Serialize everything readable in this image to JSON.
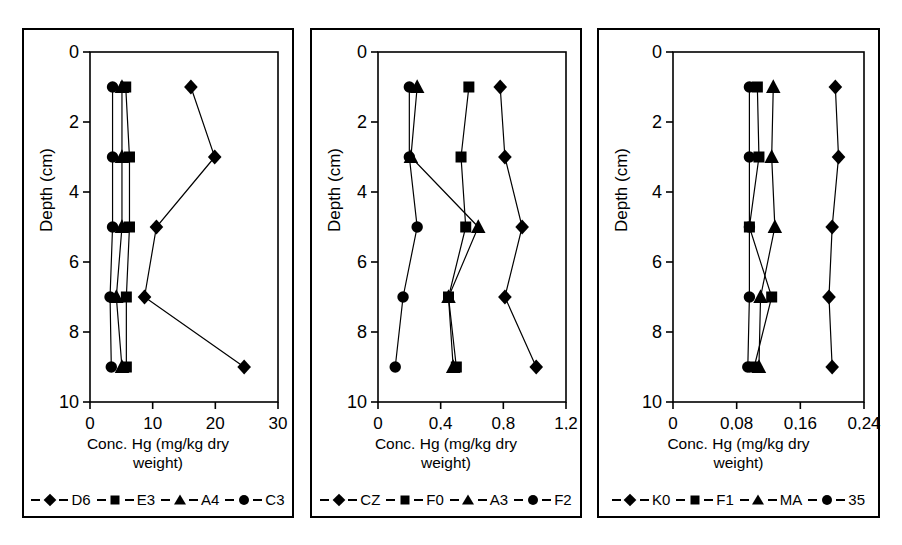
{
  "figure": {
    "panel_count": 3,
    "shared_xlabel": "Conc. Hg (mg/kg dry weight)",
    "shared_ylabel": "Depth (cm)"
  },
  "chart_data": [
    {
      "type": "line",
      "title": "",
      "xlabel": "Conc. Hg (mg/kg dry weight)",
      "ylabel": "Depth (cm)",
      "xlim": [
        0,
        30
      ],
      "ylim": [
        0,
        10
      ],
      "y_inverted": true,
      "xticks": [
        "0",
        "10",
        "20",
        "30"
      ],
      "xtick_values": [
        0,
        10,
        20,
        30
      ],
      "yticks": [
        "0",
        "2",
        "4",
        "6",
        "8",
        "10"
      ],
      "ytick_values": [
        0,
        2,
        4,
        6,
        8,
        10
      ],
      "grid": false,
      "legend_position": "bottom",
      "depths": [
        1,
        3,
        5,
        7,
        9
      ],
      "series": [
        {
          "name": "D6",
          "marker": "diamond",
          "values": [
            16.1,
            19.9,
            10.6,
            8.7,
            24.6
          ]
        },
        {
          "name": "E3",
          "marker": "square",
          "values": [
            5.7,
            6.3,
            6.3,
            5.8,
            5.8
          ]
        },
        {
          "name": "A4",
          "marker": "triangle",
          "values": [
            5.1,
            5.1,
            5.1,
            4.2,
            5.1
          ]
        },
        {
          "name": "C3",
          "marker": "circle",
          "values": [
            3.6,
            3.6,
            3.6,
            3.2,
            3.4
          ]
        }
      ]
    },
    {
      "type": "line",
      "title": "",
      "xlabel": "Conc. Hg (mg/kg dry weight)",
      "ylabel": "Depth (cm)",
      "xlim": [
        0,
        1.2
      ],
      "ylim": [
        0,
        10
      ],
      "y_inverted": true,
      "xticks": [
        "0",
        "0,4",
        "0,8",
        "1,2"
      ],
      "xtick_values": [
        0,
        0.4,
        0.8,
        1.2
      ],
      "yticks": [
        "0",
        "2",
        "4",
        "6",
        "8",
        "10"
      ],
      "ytick_values": [
        0,
        2,
        4,
        6,
        8,
        10
      ],
      "grid": false,
      "legend_position": "bottom",
      "depths": [
        1,
        3,
        5,
        7,
        9
      ],
      "series": [
        {
          "name": "CZ",
          "marker": "diamond",
          "values": [
            0.78,
            0.81,
            0.92,
            0.81,
            1.01
          ]
        },
        {
          "name": "F0",
          "marker": "square",
          "values": [
            0.58,
            0.53,
            0.56,
            0.45,
            0.5
          ]
        },
        {
          "name": "A3",
          "marker": "triangle",
          "values": [
            0.25,
            0.21,
            0.64,
            0.45,
            0.48
          ]
        },
        {
          "name": "F2",
          "marker": "circle",
          "values": [
            0.2,
            0.2,
            0.25,
            0.16,
            0.11
          ]
        }
      ]
    },
    {
      "type": "line",
      "title": "",
      "xlabel": "Conc. Hg (mg/kg dry weight)",
      "ylabel": "Depth (cm)",
      "xlim": [
        0,
        0.24
      ],
      "ylim": [
        0,
        10
      ],
      "y_inverted": true,
      "xticks": [
        "0",
        "0,08",
        "0,16",
        "0,24"
      ],
      "xtick_values": [
        0,
        0.08,
        0.16,
        0.24
      ],
      "yticks": [
        "0",
        "2",
        "4",
        "6",
        "8",
        "10"
      ],
      "ytick_values": [
        0,
        2,
        4,
        6,
        8,
        10
      ],
      "grid": false,
      "legend_position": "bottom",
      "depths": [
        1,
        3,
        5,
        7,
        9
      ],
      "series": [
        {
          "name": "K0",
          "marker": "diamond",
          "values": [
            0.204,
            0.208,
            0.2,
            0.196,
            0.2
          ]
        },
        {
          "name": "F1",
          "marker": "square",
          "values": [
            0.106,
            0.108,
            0.096,
            0.124,
            0.102
          ]
        },
        {
          "name": "MA",
          "marker": "triangle",
          "values": [
            0.126,
            0.124,
            0.128,
            0.11,
            0.108
          ]
        },
        {
          "name": "35",
          "marker": "circle",
          "values": [
            0.096,
            0.096,
            0.096,
            0.096,
            0.094
          ]
        }
      ]
    }
  ],
  "panels": [
    {
      "id": "panel-0",
      "xlabel_line1": "Conc. Hg (mg/kg dry",
      "xlabel_line2": "weight)",
      "ylabel": "Depth (cm)",
      "legend": [
        {
          "label": "D6",
          "marker": "diamond"
        },
        {
          "label": "E3",
          "marker": "square"
        },
        {
          "label": "A4",
          "marker": "triangle"
        },
        {
          "label": "C3",
          "marker": "circle"
        }
      ]
    },
    {
      "id": "panel-1",
      "xlabel_line1": "Conc. Hg (mg/kg dry",
      "xlabel_line2": "weight)",
      "ylabel": "Depth (cm)",
      "legend": [
        {
          "label": "CZ",
          "marker": "diamond"
        },
        {
          "label": "F0",
          "marker": "square"
        },
        {
          "label": "A3",
          "marker": "triangle"
        },
        {
          "label": "F2",
          "marker": "circle"
        }
      ]
    },
    {
      "id": "panel-2",
      "xlabel_line1": "Conc. Hg (mg/kg dry",
      "xlabel_line2": "weight)",
      "ylabel": "Depth (cm)",
      "legend": [
        {
          "label": "K0",
          "marker": "diamond"
        },
        {
          "label": "F1",
          "marker": "square"
        },
        {
          "label": "MA",
          "marker": "triangle"
        },
        {
          "label": "35",
          "marker": "circle"
        }
      ]
    }
  ],
  "style": {
    "line_color": "#000000",
    "marker_color": "#000000",
    "axis_color": "#000000",
    "background": "#ffffff"
  }
}
